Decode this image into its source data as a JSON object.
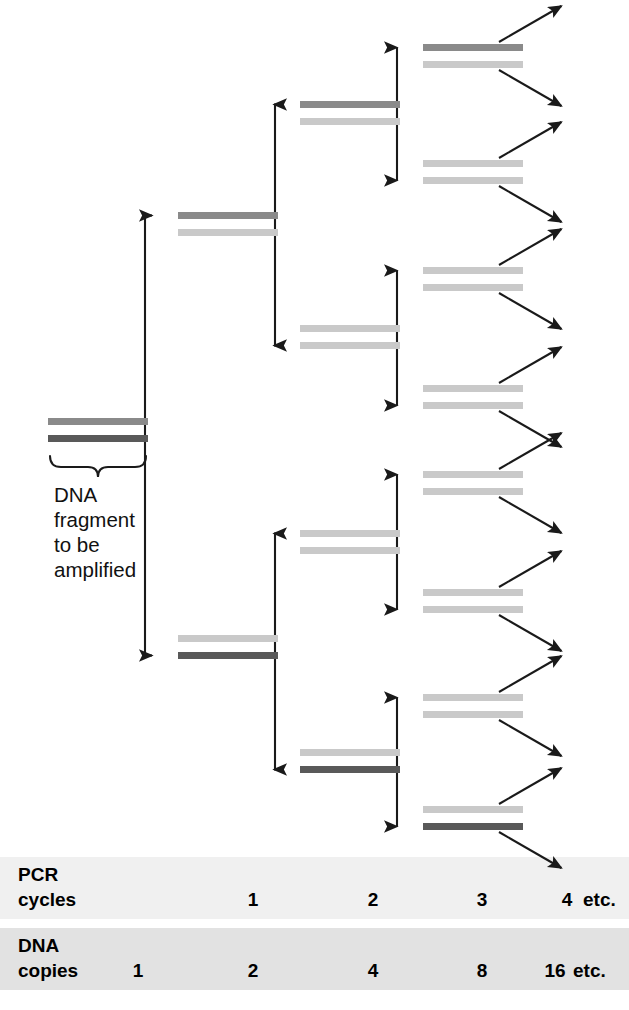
{
  "figure": {
    "background": "#ffffff"
  },
  "colors": {
    "strand_original_top": "#8a8a8a",
    "strand_original_bottom": "#595959",
    "strand_new": "#c9c9c9",
    "line": "#1a1a1a",
    "text": "#000000",
    "band_light": "#f0f0f0",
    "band_dark": "#e2e2e2"
  },
  "fragment_label": {
    "name": "dna-fragment-label",
    "lines": [
      "DNA",
      "fragment",
      "to be",
      "amplified"
    ]
  },
  "legend": {
    "cycles_row": {
      "title_lines": [
        "PCR",
        "cycles"
      ],
      "values": [
        "1",
        "2",
        "3",
        "4"
      ],
      "etc": "etc.",
      "value_x": [
        253,
        373,
        482,
        567
      ],
      "etc_x": 583,
      "band_y": 857,
      "band_height": 62
    },
    "copies_row": {
      "title_lines": [
        "DNA",
        "copies"
      ],
      "values": [
        "1",
        "2",
        "4",
        "8",
        "16"
      ],
      "etc": "etc.",
      "value_x": [
        138,
        253,
        373,
        482,
        555
      ],
      "etc_x": 573,
      "band_y": 928,
      "band_height": 62
    }
  },
  "chart_data": {
    "type": "diagram",
    "cycles": [
      0,
      1,
      2,
      3,
      4
    ],
    "dna_copies": [
      1,
      2,
      4,
      8,
      16
    ],
    "columns": [
      {
        "cycle": 0,
        "x": 48,
        "width": 100,
        "duplexes": [
          {
            "id": "d0",
            "top_y": 418,
            "strands": [
              "original_top",
              "original_bottom"
            ]
          }
        ]
      },
      {
        "cycle": 1,
        "x": 178,
        "width": 100,
        "duplexes": [
          {
            "id": "d1a",
            "top_y": 212,
            "strands": [
              "original_top",
              "new"
            ],
            "entry_strand": 0
          },
          {
            "id": "d1b",
            "top_y": 635,
            "strands": [
              "new",
              "original_bottom"
            ],
            "entry_strand": 1
          }
        ]
      },
      {
        "cycle": 2,
        "x": 300,
        "width": 100,
        "duplexes": [
          {
            "id": "d2a",
            "top_y": 101,
            "strands": [
              "original_top",
              "new"
            ],
            "entry_strand": 0
          },
          {
            "id": "d2b",
            "top_y": 325,
            "strands": [
              "new",
              "new"
            ],
            "entry_strand": 1
          },
          {
            "id": "d2c",
            "top_y": 530,
            "strands": [
              "new",
              "new"
            ],
            "entry_strand": 0
          },
          {
            "id": "d2d",
            "top_y": 749,
            "strands": [
              "new",
              "original_bottom"
            ],
            "entry_strand": 1
          }
        ]
      },
      {
        "cycle": 3,
        "x": 423,
        "width": 100,
        "duplexes": [
          {
            "id": "d3a",
            "top_y": 44,
            "strands": [
              "original_top",
              "new"
            ],
            "entry_strand": 0
          },
          {
            "id": "d3b",
            "top_y": 160,
            "strands": [
              "new",
              "new"
            ],
            "entry_strand": 1
          },
          {
            "id": "d3c",
            "top_y": 267,
            "strands": [
              "new",
              "new"
            ],
            "entry_strand": 0
          },
          {
            "id": "d3d",
            "top_y": 385,
            "strands": [
              "new",
              "new"
            ],
            "entry_strand": 1
          },
          {
            "id": "d3e",
            "top_y": 471,
            "strands": [
              "new",
              "new"
            ],
            "entry_strand": 0
          },
          {
            "id": "d3f",
            "top_y": 589,
            "strands": [
              "new",
              "new"
            ],
            "entry_strand": 1
          },
          {
            "id": "d3g",
            "top_y": 694,
            "strands": [
              "new",
              "new"
            ],
            "entry_strand": 0
          },
          {
            "id": "d3h",
            "top_y": 806,
            "strands": [
              "new",
              "original_bottom"
            ],
            "entry_strand": 1
          }
        ]
      }
    ],
    "branches": [
      {
        "from": "d0",
        "to": [
          "d1a",
          "d1b"
        ]
      },
      {
        "from": "d1a",
        "to": [
          "d2a",
          "d2b"
        ]
      },
      {
        "from": "d1b",
        "to": [
          "d2c",
          "d2d"
        ]
      },
      {
        "from": "d2a",
        "to": [
          "d3a",
          "d3b"
        ]
      },
      {
        "from": "d2b",
        "to": [
          "d3c",
          "d3d"
        ]
      },
      {
        "from": "d2c",
        "to": [
          "d3e",
          "d3f"
        ]
      },
      {
        "from": "d2d",
        "to": [
          "d3g",
          "d3h"
        ]
      }
    ],
    "exit_arrows": {
      "count_per_duplex": 2,
      "length": 72,
      "angle_degrees": 30,
      "note": "Each cycle-3 duplex emits two diagonal arrows representing cycle 4 products"
    },
    "strand_geometry": {
      "strand_height": 7,
      "strand_gap": 17
    }
  }
}
